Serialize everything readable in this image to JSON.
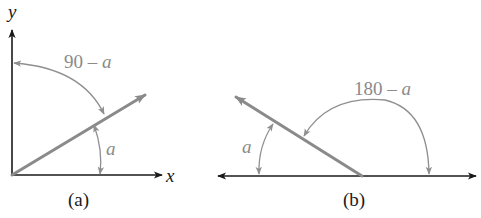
{
  "panels": [
    {
      "id": "a",
      "caption": "(a)",
      "axis_labels": {
        "x": "x",
        "y": "y"
      },
      "angle_labels": {
        "complement_num": "90",
        "complement_op": " – ",
        "complement_var": "a",
        "angle": "a"
      }
    },
    {
      "id": "b",
      "caption": "(b)",
      "angle_labels": {
        "supplement_num": "180",
        "supplement_op": " – ",
        "supplement_var": "a",
        "angle": "a"
      }
    }
  ],
  "colors": {
    "axis": "#1a1a1a",
    "ray": "#8a8a8a",
    "arc": "#8f8f8f",
    "label_gray": "#8a8a8a"
  }
}
